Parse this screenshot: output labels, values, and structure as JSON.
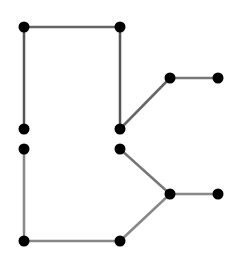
{
  "diagram": {
    "type": "graph",
    "background": "#ffffff",
    "node_color": "#000000",
    "node_radius": 5.5,
    "nodes": [
      {
        "id": "n1",
        "x": 24,
        "y": 27
      },
      {
        "id": "n2",
        "x": 120,
        "y": 27
      },
      {
        "id": "n3",
        "x": 24,
        "y": 129
      },
      {
        "id": "n4",
        "x": 120,
        "y": 129
      },
      {
        "id": "n5",
        "x": 170,
        "y": 78
      },
      {
        "id": "n6",
        "x": 218,
        "y": 78
      },
      {
        "id": "n7",
        "x": 24,
        "y": 149
      },
      {
        "id": "n8",
        "x": 120,
        "y": 149
      },
      {
        "id": "n9",
        "x": 170,
        "y": 194
      },
      {
        "id": "n10",
        "x": 218,
        "y": 194
      },
      {
        "id": "n11",
        "x": 24,
        "y": 241
      },
      {
        "id": "n12",
        "x": 120,
        "y": 241
      }
    ],
    "edges": [
      {
        "from": "n1",
        "to": "n2",
        "color": "#666666"
      },
      {
        "from": "n1",
        "to": "n3",
        "color": "#555555"
      },
      {
        "from": "n2",
        "to": "n4",
        "color": "#555555"
      },
      {
        "from": "n4",
        "to": "n5",
        "color": "#666666"
      },
      {
        "from": "n5",
        "to": "n6",
        "color": "#777777"
      },
      {
        "from": "n7",
        "to": "n11",
        "color": "#888888"
      },
      {
        "from": "n11",
        "to": "n12",
        "color": "#888888"
      },
      {
        "from": "n8",
        "to": "n9",
        "color": "#777777"
      },
      {
        "from": "n12",
        "to": "n9",
        "color": "#888888"
      },
      {
        "from": "n9",
        "to": "n10",
        "color": "#888888"
      }
    ]
  }
}
